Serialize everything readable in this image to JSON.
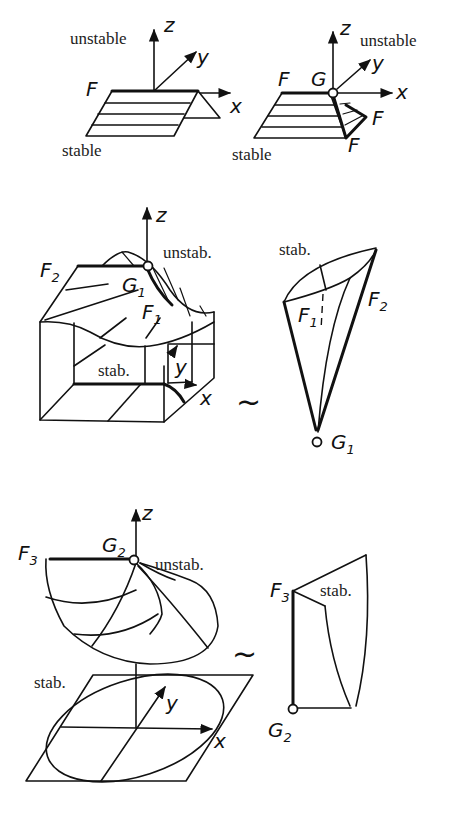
{
  "figure": {
    "panel_1a": {
      "labels": {
        "unstable": "unstable",
        "stable": "stable",
        "z": "z",
        "y": "y",
        "x": "x",
        "F": "F"
      }
    },
    "panel_1b": {
      "labels": {
        "unstable": "unstable",
        "stable": "stable",
        "z": "z",
        "y": "y",
        "x": "x",
        "F": "F",
        "G": "G",
        "F_right": "F",
        "F_bottom": "F"
      }
    },
    "panel_2": {
      "surface_labels": {
        "z": "z",
        "unstab": "unstab.",
        "F2": "F",
        "F2_sub": "2",
        "G1": "G",
        "G1_sub": "1",
        "F1": "F",
        "F1_sub": "1",
        "stab": "stab.",
        "y": "y",
        "x": "x"
      },
      "equivalence": "~",
      "cone_labels": {
        "stab": "stab.",
        "F1": "F",
        "F1_sub": "1",
        "F2": "F",
        "F2_sub": "2",
        "G1": "G",
        "G1_sub": "1"
      }
    },
    "panel_3": {
      "surface_labels": {
        "z": "z",
        "F3": "F",
        "F3_sub": "3",
        "G2": "G",
        "G2_sub": "2",
        "unstab": "unstab.",
        "stab": "stab.",
        "y": "y",
        "x": "x"
      },
      "equivalence": "~",
      "cone_labels": {
        "F3": "F",
        "F3_sub": "3",
        "stab": "stab.",
        "G2": "G",
        "G2_sub": "2"
      }
    }
  }
}
